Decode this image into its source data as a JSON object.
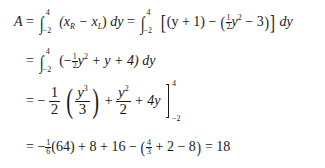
{
  "equation": {
    "line1": {
      "lhs": "A",
      "eq": "=",
      "int_upper": "4",
      "int_lower": "−2",
      "integrand_a": "(x",
      "sub_r": "R",
      "minus": " − x",
      "sub_l": "L",
      "close": ")",
      "dy": " dy",
      "eq2": " = ",
      "int2_upper": "4",
      "int2_lower": "−2",
      "bracket_open": "[",
      "term1": "(y + 1) − ",
      "paren_open": "(",
      "half_n": "1",
      "half_d": "2",
      "y_sq": "y",
      "sq": "2",
      "minus3": " − 3",
      "paren_close": ")",
      "bracket_close": "]",
      "dy2": " dy"
    },
    "line2": {
      "eq": "=",
      "int_upper": "4",
      "int_lower": "−2",
      "open": "(−",
      "half_n": "1",
      "half_d": "2",
      "y": "y",
      "sq": "2",
      "rest": " + y + 4)",
      "dy": " dy"
    },
    "line3": {
      "eq": "= −",
      "f1_n": "1",
      "f1_d": "2",
      "f2_n": "y",
      "f2_n_exp": "3",
      "f2_d": "3",
      "plus": " + ",
      "f3_n": "y",
      "f3_n_exp": "2",
      "f3_d": "2",
      "rest": " + 4y",
      "upper": "4",
      "lower": "−2"
    },
    "line4": {
      "eq": "= −",
      "sixth_n": "1",
      "sixth_d": "6",
      "part1": "(64) + 8 + 16 − ",
      "paren_open": "(",
      "frac_n": "4",
      "frac_d": "3",
      "part2": " + 2 − 8",
      "paren_close": ")",
      "result": " = 18"
    }
  }
}
